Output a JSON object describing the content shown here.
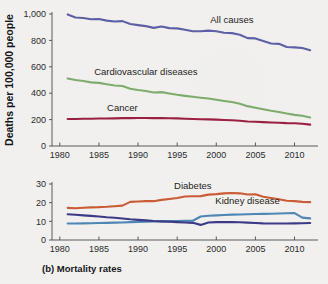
{
  "figure": {
    "caption_marker": "(b)",
    "caption_text": "Mortality rates",
    "background_color": "#f4f3f1"
  },
  "chart_data": [
    {
      "id": "top",
      "type": "line",
      "title": "",
      "xlabel": "",
      "ylabel": "Deaths per 100,000 people",
      "xlim": [
        1979,
        2013
      ],
      "ylim": [
        0,
        1000
      ],
      "grid": false,
      "legend_position": "inline-annotations",
      "xticks": [
        1980,
        1985,
        1990,
        1995,
        2000,
        2005,
        2010
      ],
      "xticklabels": [
        "1980",
        "1985",
        "1990",
        "1995",
        "2000",
        "2005",
        "2010"
      ],
      "yticks": [
        0,
        200,
        400,
        600,
        800,
        1000
      ],
      "yticklabels": [
        "0",
        "200",
        "400",
        "600",
        "800",
        "1,000"
      ],
      "x": [
        1981,
        1982,
        1983,
        1984,
        1985,
        1986,
        1987,
        1988,
        1989,
        1990,
        1991,
        1992,
        1993,
        1994,
        1995,
        1996,
        1997,
        1998,
        1999,
        2000,
        2001,
        2002,
        2003,
        2004,
        2005,
        2006,
        2007,
        2008,
        2009,
        2010,
        2011,
        2012
      ],
      "series": [
        {
          "name": "All causes",
          "color": "#5d60a6",
          "label_x": 2002,
          "label_y": 930,
          "values": [
            997,
            974,
            970,
            960,
            962,
            950,
            943,
            946,
            924,
            916,
            908,
            895,
            905,
            893,
            891,
            880,
            869,
            869,
            874,
            869,
            858,
            855,
            843,
            817,
            815,
            795,
            776,
            774,
            750,
            747,
            742,
            725
          ]
        },
        {
          "name": "Cardiovascular diseases",
          "color": "#7fae6d",
          "label_x": 1991,
          "label_y": 540,
          "values": [
            512,
            500,
            492,
            482,
            478,
            468,
            458,
            455,
            434,
            424,
            417,
            405,
            408,
            398,
            388,
            380,
            373,
            366,
            360,
            350,
            341,
            333,
            320,
            302,
            290,
            278,
            267,
            258,
            246,
            236,
            229,
            216
          ]
        },
        {
          "name": "Cancer",
          "color": "#9c1f42",
          "label_x": 1988,
          "label_y": 268,
          "values": [
            205,
            205,
            206,
            207,
            208,
            208,
            209,
            211,
            211,
            212,
            212,
            211,
            211,
            210,
            209,
            207,
            205,
            203,
            202,
            200,
            197,
            195,
            191,
            186,
            184,
            181,
            178,
            176,
            173,
            172,
            169,
            162
          ]
        }
      ]
    },
    {
      "id": "bottom",
      "type": "line",
      "title": "",
      "xlabel": "",
      "ylabel": "",
      "xlim": [
        1979,
        2013
      ],
      "ylim": [
        0,
        30
      ],
      "grid": false,
      "legend_position": "inline-annotations",
      "xticks": [
        1980,
        1985,
        1990,
        1995,
        2000,
        2005,
        2010
      ],
      "xticklabels": [
        "1980",
        "1985",
        "1990",
        "1995",
        "2000",
        "2005",
        "2010"
      ],
      "yticks": [
        0,
        10,
        20,
        30
      ],
      "yticklabels": [
        "0",
        "10",
        "20",
        "30"
      ],
      "x": [
        1981,
        1982,
        1983,
        1984,
        1985,
        1986,
        1987,
        1988,
        1989,
        1990,
        1991,
        1992,
        1993,
        1994,
        1995,
        1996,
        1997,
        1998,
        1999,
        2000,
        2001,
        2002,
        2003,
        2004,
        2005,
        2006,
        2007,
        2008,
        2009,
        2010,
        2011,
        2012
      ],
      "series": [
        {
          "name": "Diabetes",
          "color": "#cc5b34",
          "label_x": 1997,
          "label_y": 27.5,
          "values": [
            17.2,
            17.0,
            17.3,
            17.5,
            17.6,
            17.8,
            18.1,
            18.4,
            20.4,
            20.6,
            20.8,
            20.8,
            21.5,
            22.0,
            22.5,
            23.3,
            23.4,
            23.5,
            24.3,
            24.6,
            25.0,
            25.2,
            25.0,
            24.4,
            24.5,
            23.2,
            22.5,
            21.8,
            21.0,
            20.8,
            20.4,
            20.3
          ]
        },
        {
          "name": "Kidney disease",
          "color": "#4e87b6",
          "label_x": 2004,
          "label_y": 19.5,
          "values": [
            8.8,
            8.8,
            8.9,
            9.0,
            9.1,
            9.2,
            9.3,
            9.4,
            9.6,
            9.7,
            9.8,
            9.9,
            10.0,
            10.1,
            10.2,
            10.3,
            10.3,
            12.6,
            13.0,
            13.2,
            13.4,
            13.6,
            13.7,
            13.8,
            13.9,
            14.0,
            14.1,
            14.2,
            14.3,
            14.4,
            12.0,
            11.6
          ]
        },
        {
          "name": "unlabeled-dark-blue",
          "color": "#3c3a87",
          "label_x": null,
          "label_y": null,
          "values": [
            13.8,
            13.5,
            13.2,
            12.9,
            12.6,
            12.2,
            11.9,
            11.5,
            11.1,
            10.8,
            10.5,
            10.2,
            10.0,
            9.8,
            9.6,
            9.4,
            9.2,
            8.1,
            9.4,
            9.6,
            9.6,
            9.6,
            9.5,
            9.3,
            9.1,
            8.9,
            8.8,
            8.8,
            8.8,
            8.9,
            9.0,
            9.1
          ]
        }
      ]
    }
  ]
}
